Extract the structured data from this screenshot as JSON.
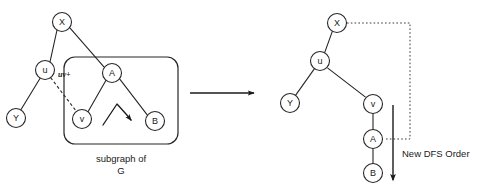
{
  "figure": {
    "background_color": "#ffffff",
    "stroke_color": "#262626"
  },
  "left_panel": {
    "name": "before-diagram",
    "nodes": [
      {
        "id": "X",
        "label": "X",
        "cx": 62,
        "cy": 22,
        "r": 9.5
      },
      {
        "id": "u",
        "label": "u",
        "cx": 45,
        "cy": 70,
        "r": 9.5
      },
      {
        "id": "Y",
        "label": "Y",
        "cx": 16,
        "cy": 118,
        "r": 9.5
      },
      {
        "id": "A",
        "label": "A",
        "cx": 112,
        "cy": 73,
        "r": 9.5
      },
      {
        "id": "v",
        "label": "v",
        "cx": 82,
        "cy": 119,
        "r": 9.5
      },
      {
        "id": "B",
        "label": "B",
        "cx": 155,
        "cy": 121,
        "r": 9.5
      }
    ],
    "solid_edges": [
      {
        "from": "X",
        "to": "u"
      },
      {
        "from": "X",
        "to": "A"
      },
      {
        "from": "u",
        "to": "Y"
      },
      {
        "from": "A",
        "to": "v"
      },
      {
        "from": "A",
        "to": "B"
      }
    ],
    "dashed_edges": [
      {
        "from": "u",
        "to": "v",
        "label": "uv+"
      }
    ],
    "edge_label": "uv+",
    "group_box": {
      "x": 64,
      "y": 57,
      "width": 114,
      "height": 87,
      "rx": 11
    },
    "caption_line_1": "subgraph of",
    "caption_line_2": "G",
    "curved_arrow_name": "insertion-direction-arrow"
  },
  "transition": {
    "name": "transform-arrow",
    "x1": 190,
    "y1": 93,
    "x2": 254,
    "y2": 93
  },
  "right_panel": {
    "name": "after-diagram",
    "nodes": [
      {
        "id": "X",
        "label": "X",
        "cx": 337,
        "cy": 23,
        "r": 9.5
      },
      {
        "id": "u",
        "label": "u",
        "cx": 320,
        "cy": 61,
        "r": 9.5
      },
      {
        "id": "Y",
        "label": "Y",
        "cx": 290,
        "cy": 103,
        "r": 9.5
      },
      {
        "id": "v",
        "label": "v",
        "cx": 373,
        "cy": 104,
        "r": 9.5
      },
      {
        "id": "A",
        "label": "A",
        "cx": 373,
        "cy": 139,
        "r": 9.5
      },
      {
        "id": "B",
        "label": "B",
        "cx": 373,
        "cy": 173,
        "r": 9.5
      }
    ],
    "solid_edges": [
      {
        "from": "X",
        "to": "u"
      },
      {
        "from": "u",
        "to": "Y"
      },
      {
        "from": "u",
        "to": "v"
      },
      {
        "from": "v",
        "to": "A"
      },
      {
        "from": "A",
        "to": "B"
      }
    ],
    "dotted_path": {
      "name": "dotted-return-edge",
      "points": "347,23 410,23 410,139 384,139"
    },
    "order_arrow": {
      "name": "dfs-order-arrow",
      "x": 393,
      "y_start": 105,
      "y_end": 180
    },
    "order_label": "New DFS Order"
  }
}
